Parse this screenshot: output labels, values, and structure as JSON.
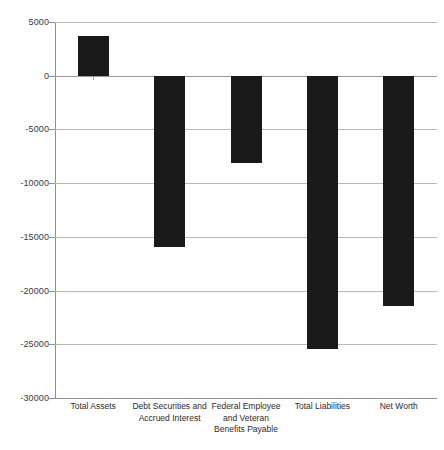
{
  "chart_data": {
    "type": "bar",
    "title": "",
    "subtitle": "",
    "xlabel": "",
    "ylabel": "",
    "categories": [
      "Total Assets",
      "Debt Securities and Accrued Interest",
      "Federal Employee and Veteran Benefits Payable",
      "Total Liabilities",
      "Net Worth"
    ],
    "values": [
      3700,
      -15900,
      -8100,
      -25400,
      -21400
    ],
    "ylim": [
      -30000,
      5000
    ],
    "yticks": [
      5000,
      0,
      -5000,
      -10000,
      -15000,
      -20000,
      -25000,
      -30000
    ],
    "ytick_labels": [
      "5000",
      "0",
      "-5000",
      "-10000",
      "-15000",
      "-20000",
      "-25000",
      "-30000"
    ],
    "grid": true,
    "legend": false,
    "bar_color": "#1a1a1a",
    "grid_color": "#b9b9b9",
    "axis_color": "#8f8f8f"
  },
  "axis": {
    "y_labels": [
      {
        "text": "5000",
        "value": 5000
      },
      {
        "text": "0",
        "value": 0
      },
      {
        "text": "-5000",
        "value": -5000
      },
      {
        "text": "-10000",
        "value": -10000
      },
      {
        "text": "-15000",
        "value": -15000
      },
      {
        "text": "-20000",
        "value": -20000
      },
      {
        "text": "-25000",
        "value": -25000
      },
      {
        "text": "-30000",
        "value": -30000
      }
    ]
  },
  "categories_display": [
    {
      "line1": "Total Assets",
      "line2": "",
      "line3": ""
    },
    {
      "line1": "Debt Securities and",
      "line2": "Accrued Interest",
      "line3": ""
    },
    {
      "line1": "Federal Employee",
      "line2": "and Veteran",
      "line3": "Benefits Payable"
    },
    {
      "line1": "Total Liabilities",
      "line2": "",
      "line3": ""
    },
    {
      "line1": "Net Worth",
      "line2": "",
      "line3": ""
    }
  ]
}
